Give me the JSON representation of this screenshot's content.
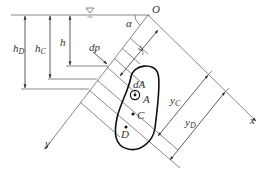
{
  "diagram": {
    "type": "hydrostatic-pressure-on-inclined-plane",
    "labels": {
      "origin": "O",
      "angle": "α",
      "surface_symbol": "∇",
      "h": "h",
      "hC_main": "h",
      "hC_sub": "C",
      "hD_main": "h",
      "hD_sub": "D",
      "dp": "dp",
      "dA": "dA",
      "point_A": "A",
      "point_C": "C",
      "point_D": "D",
      "y": "y",
      "yC_main": "y",
      "yC_sub": "C",
      "yD_main": "y",
      "yD_sub": "D",
      "x_axis": "x",
      "y_axis": "y"
    },
    "colors": {
      "line": "#6a6a6a",
      "shape": "#111111",
      "text": "#333333"
    }
  }
}
